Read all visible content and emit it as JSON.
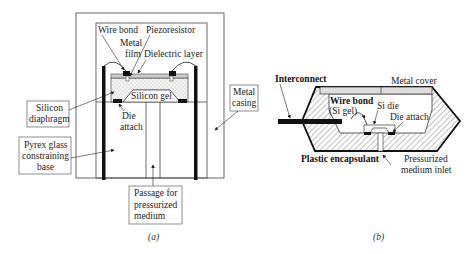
{
  "figure_a": {
    "caption": "(a)",
    "labels": {
      "wire_bond": "Wire bond",
      "piezoresistor": "Piezoresistor",
      "metal_film_1": "Metal",
      "metal_film_2": "film",
      "dielectric_layer": "Dielectric layer",
      "silicon_gel": "Silicon gel",
      "die_attach_1": "Die",
      "die_attach_2": "attach",
      "silicon_diaphragm_1": "Silicon",
      "silicon_diaphragm_2": "diaphragm",
      "metal_casing_1": "Metal",
      "metal_casing_2": "casing",
      "pyrex_1": "Pyrex glass",
      "pyrex_2": "constraining",
      "pyrex_3": "base",
      "passage_1": "Passage for",
      "passage_2": "pressurized",
      "passage_3": "medium"
    }
  },
  "figure_b": {
    "caption": "(b)",
    "labels": {
      "interconnect": "Interconnect",
      "metal_cover": "Metal cover",
      "wire_bond": "Wire bond",
      "si_gel": "(Si gel)",
      "si_die": "Si die",
      "die_attach": "Die attach",
      "plastic_encapsulant": "Plastic encapsulant",
      "pressurized_1": "Pressurized",
      "pressurized_2": "medium inlet"
    }
  }
}
